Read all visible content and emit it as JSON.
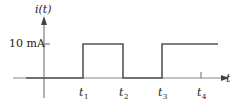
{
  "chart_data": {
    "type": "line",
    "title": "",
    "ylabel": "i(t)",
    "xlabel": "t",
    "y_tick_label": "10 mA",
    "y_tick_value": 10,
    "y_unit": "mA",
    "x_tick_labels": [
      "t1",
      "t2",
      "t3",
      "t4"
    ],
    "x_tick_subscripts": [
      "1",
      "2",
      "3",
      "4"
    ],
    "waveform": "square pulse",
    "series": [
      {
        "name": "i(t)",
        "points": [
          {
            "x": "start",
            "y": 0
          },
          {
            "x": "t1",
            "y": 0
          },
          {
            "x": "t1",
            "y": 10
          },
          {
            "x": "t2",
            "y": 10
          },
          {
            "x": "t2",
            "y": 0
          },
          {
            "x": "t3",
            "y": 0
          },
          {
            "x": "t3",
            "y": 10
          },
          {
            "x": "end",
            "y": 10
          }
        ]
      }
    ],
    "grid": false
  },
  "colors": {
    "axis": "#555555",
    "signal": "#555555",
    "text": "#222222"
  }
}
